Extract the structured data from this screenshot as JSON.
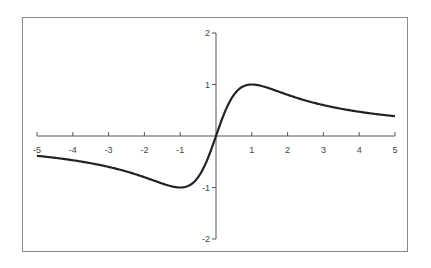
{
  "chart_data": {
    "type": "line",
    "title": "",
    "xlabel": "",
    "ylabel": "",
    "function": "y = 2x / (1 + x^2)",
    "xlim": [
      -5,
      5
    ],
    "ylim": [
      -2,
      2
    ],
    "grid": false,
    "legend": null,
    "x_ticks": [
      "-5",
      "-4",
      "-3",
      "-2",
      "-1",
      "1",
      "2",
      "3",
      "4",
      "5"
    ],
    "y_ticks": [
      "2",
      "1",
      "-1",
      "-2"
    ],
    "series": [
      {
        "name": "curve",
        "color": "#222222",
        "x": [
          -5,
          -4,
          -3,
          -2,
          -1.5,
          -1,
          -0.5,
          0,
          0.5,
          1,
          1.5,
          2,
          3,
          4,
          5
        ],
        "y": [
          -0.385,
          -0.471,
          -0.6,
          -0.8,
          -0.923,
          -1.0,
          -0.8,
          0,
          0.8,
          1.0,
          0.923,
          0.8,
          0.6,
          0.471,
          0.385
        ]
      }
    ]
  }
}
